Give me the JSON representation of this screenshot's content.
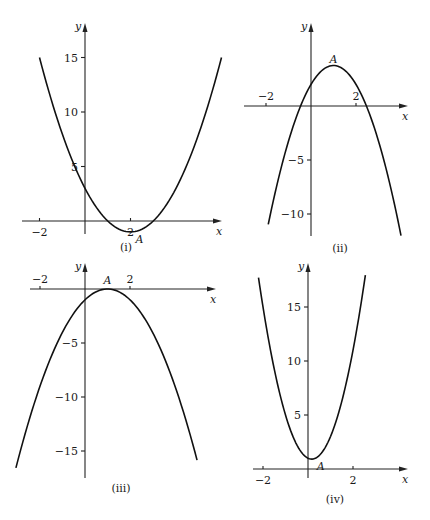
{
  "chart_data": [
    {
      "type": "line",
      "panel": "(i)",
      "title": "(i)",
      "xlabel": "x",
      "ylabel": "y",
      "function": "y = x^2 - 4x + 3",
      "coefficients": {
        "a": 1,
        "b": -4,
        "c": 3
      },
      "x_range": [
        -2,
        6
      ],
      "ylim": [
        -1.5,
        17
      ],
      "x_ticks": [
        {
          "value": -2,
          "label": "−2"
        },
        {
          "value": 2,
          "label": "2"
        }
      ],
      "y_ticks": [
        {
          "value": 5,
          "label": "5"
        },
        {
          "value": 10,
          "label": "10"
        },
        {
          "value": 15,
          "label": "15"
        }
      ],
      "annotations": [
        {
          "label": "A",
          "x": 2,
          "y": -1,
          "note": "minimum point"
        }
      ],
      "grid": false,
      "pixel_frame": {
        "ox": 85,
        "oy": 221,
        "sx": 22.75,
        "sy": 10.9,
        "x_axis": [
          22,
          222
        ],
        "y_axis": [
          23,
          234
        ],
        "label_pos": [
          126,
          251
        ]
      }
    },
    {
      "type": "line",
      "panel": "(ii)",
      "title": "(ii)",
      "xlabel": "x",
      "ylabel": "y",
      "function": "y = 2 + 3.5x - 1.75x^2",
      "coefficients": {
        "a": -1.75,
        "b": 3.5,
        "c": 2
      },
      "x_range": [
        -1.9,
        4.0
      ],
      "ylim": [
        -12,
        4
      ],
      "x_ticks": [
        {
          "value": -2,
          "label": "−2"
        },
        {
          "value": 2,
          "label": "2"
        }
      ],
      "y_ticks": [
        {
          "value": -5,
          "label": "−5"
        },
        {
          "value": -10,
          "label": "−10"
        }
      ],
      "annotations": [
        {
          "label": "A",
          "x": 1,
          "y": 3.5,
          "note": "maximum point"
        }
      ],
      "grid": false,
      "pixel_frame": {
        "ox": 311,
        "oy": 106,
        "sx": 22.5,
        "sy": 10.8,
        "x_axis": [
          244,
          408
        ],
        "y_axis": [
          23,
          236
        ],
        "label_pos": [
          340,
          252
        ]
      }
    },
    {
      "type": "line",
      "panel": "(iii)",
      "title": "(iii)",
      "xlabel": "x",
      "ylabel": "y",
      "function": "y = -x^2 + 2x - 1",
      "coefficients": {
        "a": -1,
        "b": 2,
        "c": -1
      },
      "x_range": [
        -3.07,
        4.98
      ],
      "ylim": [
        -17,
        1
      ],
      "x_ticks": [
        {
          "value": -2,
          "label": "−2"
        },
        {
          "value": 2,
          "label": "2"
        }
      ],
      "y_ticks": [
        {
          "value": -5,
          "label": "−5"
        },
        {
          "value": -10,
          "label": "−10"
        },
        {
          "value": -15,
          "label": "−15"
        }
      ],
      "annotations": [
        {
          "label": "A",
          "x": 1,
          "y": 0,
          "note": "maximum point"
        }
      ],
      "grid": false,
      "pixel_frame": {
        "ox": 85,
        "oy": 289,
        "sx": 22.5,
        "sy": 10.8,
        "x_axis": [
          30,
          216
        ],
        "y_axis": [
          263,
          478
        ],
        "label_pos": [
          121,
          492
        ]
      }
    },
    {
      "type": "line",
      "panel": "(iv)",
      "title": "(iv)",
      "xlabel": "x",
      "ylabel": "y",
      "function": "y = 3x^2 - x + 1",
      "coefficients": {
        "a": 3,
        "b": -1,
        "c": 1
      },
      "x_range": [
        -2.2,
        2.55
      ],
      "ylim": [
        0,
        18
      ],
      "x_ticks": [
        {
          "value": -2,
          "label": "−2"
        },
        {
          "value": 2,
          "label": "2"
        }
      ],
      "y_ticks": [
        {
          "value": 5,
          "label": "5"
        },
        {
          "value": 10,
          "label": "10"
        },
        {
          "value": 15,
          "label": "15"
        }
      ],
      "annotations": [
        {
          "label": "A",
          "x": 0.17,
          "y": 0.92,
          "note": "minimum point"
        }
      ],
      "grid": false,
      "pixel_frame": {
        "ox": 308,
        "oy": 469,
        "sx": 22.5,
        "sy": 10.8,
        "x_axis": [
          253,
          408
        ],
        "y_axis": [
          263,
          478
        ],
        "label_pos": [
          335,
          503
        ]
      }
    }
  ]
}
